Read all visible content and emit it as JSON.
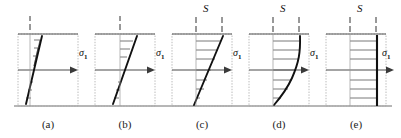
{
  "figure": {
    "baseline_label": "ground-line",
    "colors": {
      "box_outline": "#9a9a9a",
      "box_top": "#555555",
      "profile_line": "#111111",
      "hatch_line": "#444444",
      "axis_arrow": "#444444",
      "dash_tick": "#333333",
      "text": "#1a1a1a",
      "background": "#ffffff"
    },
    "panels": [
      {
        "id": "a",
        "caption": "(a)",
        "sigma_label": "σ",
        "sigma_subscript": "1",
        "s_label": null,
        "top_ticks": 1,
        "profile_type": "steep-straight",
        "hatch_count": 6,
        "x": 18,
        "width": 60
      },
      {
        "id": "b",
        "caption": "(b)",
        "sigma_label": "σ",
        "sigma_subscript": "1",
        "s_label": null,
        "top_ticks": 1,
        "profile_type": "inclined-straight",
        "hatch_count": 6,
        "x": 95,
        "width": 60
      },
      {
        "id": "c",
        "caption": "(c)",
        "sigma_label": "σ",
        "sigma_subscript": "1",
        "s_label": "S",
        "top_ticks": 2,
        "profile_type": "wide-straight",
        "hatch_count": 7,
        "x": 172,
        "width": 60
      },
      {
        "id": "d",
        "caption": "(d)",
        "sigma_label": "σ",
        "sigma_subscript": "1",
        "s_label": "S",
        "top_ticks": 2,
        "profile_type": "concave-curve",
        "hatch_count": 7,
        "x": 249,
        "width": 60
      },
      {
        "id": "e",
        "caption": "(e)",
        "sigma_label": "σ",
        "sigma_subscript": "1",
        "s_label": "S",
        "top_ticks": 2,
        "profile_type": "vertical-plug",
        "hatch_count": 6,
        "x": 326,
        "width": 60
      }
    ]
  }
}
